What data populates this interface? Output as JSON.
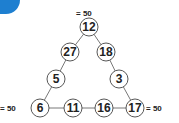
{
  "accent_color": "#1e7fd0",
  "puzzle": {
    "sums": {
      "top": "= 50",
      "left": "= 50",
      "right": "= 50"
    },
    "nodes": [
      {
        "id": "top",
        "value": "12",
        "x": 89,
        "y": 27
      },
      {
        "id": "left-upper",
        "value": "27",
        "x": 70,
        "y": 52
      },
      {
        "id": "right-upper",
        "value": "18",
        "x": 106,
        "y": 52
      },
      {
        "id": "left-mid",
        "value": "5",
        "x": 56,
        "y": 79
      },
      {
        "id": "right-mid",
        "value": "3",
        "x": 119,
        "y": 79
      },
      {
        "id": "bottom-left",
        "value": "6",
        "x": 40,
        "y": 108
      },
      {
        "id": "bottom-2",
        "value": "11",
        "x": 73,
        "y": 108
      },
      {
        "id": "bottom-3",
        "value": "16",
        "x": 104,
        "y": 108
      },
      {
        "id": "bottom-right",
        "value": "17",
        "x": 135,
        "y": 108
      }
    ]
  }
}
